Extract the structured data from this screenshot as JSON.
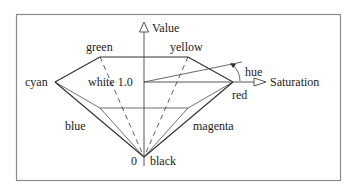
{
  "diagram": {
    "axes": {
      "value_label": "Value",
      "saturation_label": "Saturation",
      "hue_label": "hue"
    },
    "vertices": {
      "green": "green",
      "yellow": "yellow",
      "cyan": "cyan",
      "red": "red",
      "blue": "blue",
      "magenta": "magenta",
      "black": "black",
      "white": "white 1.0",
      "zero": "0"
    },
    "colors": {
      "stroke": "#333333",
      "frame": "#888888",
      "text": "#222222",
      "background": "#ffffff"
    }
  }
}
